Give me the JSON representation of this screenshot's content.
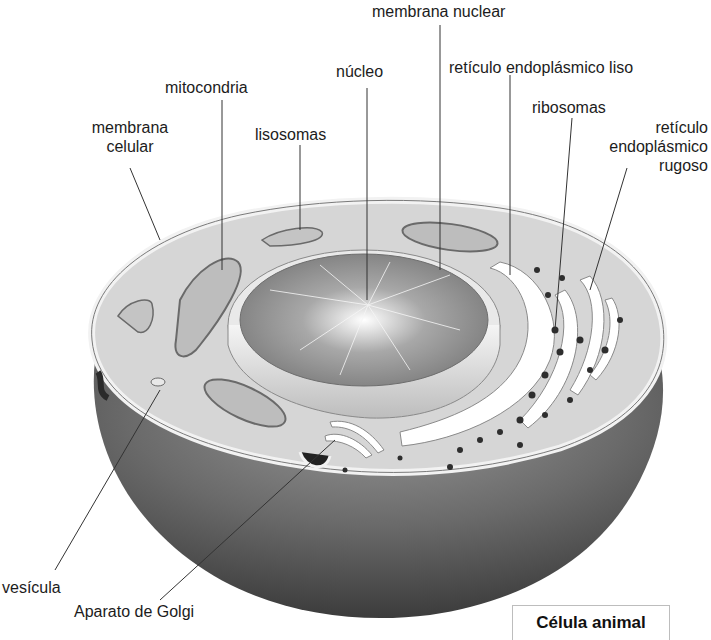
{
  "title": "Célula animal",
  "labels": {
    "membrana_nuclear": "membrana nuclear",
    "nucleo": "núcleo",
    "reticulo_liso": "retículo endoplásmico liso",
    "mitocondria": "mitocondria",
    "ribosomas": "ribosomas",
    "lisosomas": "lisosomas",
    "membrana_celular_1": "membrana",
    "membrana_celular_2": "celular",
    "reticulo_rugoso_1": "retículo",
    "reticulo_rugoso_2": "endoplásmico",
    "reticulo_rugoso_3": "rugoso",
    "vesicula": "vesícula",
    "golgi": "Aparato de Golgi"
  },
  "colors": {
    "cytoplasm": "#d6d6d6",
    "membrane": "#f2f2f2",
    "body_dark": "#5a5a5a",
    "nucleus": "#8c8c8c",
    "leader_line": "#333333"
  }
}
